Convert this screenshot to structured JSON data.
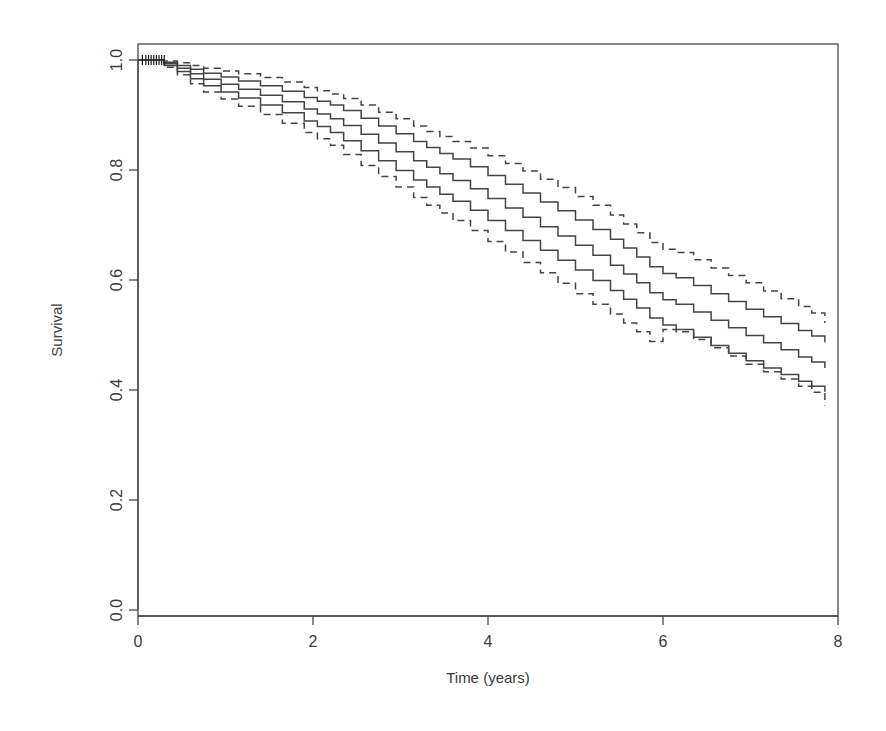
{
  "figure": {
    "kind": "kaplan-meier-survival-plot",
    "background_color": "#ffffff",
    "line_color": "#444444"
  },
  "chart_data": {
    "type": "line",
    "title": "",
    "subtitle": "",
    "xlabel": "Time (years)",
    "ylabel": "Survival",
    "xlim": [
      0,
      8
    ],
    "ylim": [
      0.0,
      1.0
    ],
    "xticks": [
      0,
      2,
      4,
      6,
      8
    ],
    "xtick_labels": [
      "0",
      "2",
      "4",
      "6",
      "8"
    ],
    "yticks": [
      0.0,
      0.2,
      0.4,
      0.6,
      0.8,
      1.0
    ],
    "ytick_labels": [
      "0.0",
      "0.2",
      "0.4",
      "0.6",
      "0.8",
      "1.0"
    ],
    "grid": false,
    "legend": "none",
    "legend_position": "none",
    "step_shape": "hv",
    "annotations": [
      "Censoring tick marks clustered near t = 0.1-0.3 at survival 1.0"
    ],
    "series": [
      {
        "name": "Upper 95% confidence band",
        "style": "dashed",
        "color": "#444444",
        "x": [
          0.0,
          0.3,
          0.45,
          0.6,
          0.75,
          0.95,
          1.15,
          1.4,
          1.65,
          1.9,
          2.05,
          2.2,
          2.35,
          2.55,
          2.75,
          2.95,
          3.15,
          3.3,
          3.45,
          3.6,
          3.8,
          4.0,
          4.2,
          4.4,
          4.6,
          4.8,
          5.0,
          5.2,
          5.4,
          5.55,
          5.7,
          5.85,
          6.0,
          6.15,
          6.35,
          6.55,
          6.75,
          6.95,
          7.15,
          7.35,
          7.55,
          7.7,
          7.85
        ],
        "y": [
          1.0,
          0.998,
          0.995,
          0.99,
          0.985,
          0.98,
          0.975,
          0.968,
          0.96,
          0.95,
          0.944,
          0.938,
          0.93,
          0.918,
          0.905,
          0.893,
          0.88,
          0.87,
          0.861,
          0.852,
          0.84,
          0.826,
          0.812,
          0.798,
          0.783,
          0.768,
          0.752,
          0.736,
          0.718,
          0.702,
          0.686,
          0.668,
          0.656,
          0.65,
          0.637,
          0.622,
          0.608,
          0.595,
          0.58,
          0.566,
          0.552,
          0.54,
          0.522
        ]
      },
      {
        "name": "Upper survival estimate",
        "style": "solid",
        "color": "#444444",
        "x": [
          0.0,
          0.3,
          0.45,
          0.6,
          0.75,
          0.95,
          1.15,
          1.4,
          1.65,
          1.9,
          2.05,
          2.2,
          2.35,
          2.55,
          2.75,
          2.95,
          3.15,
          3.3,
          3.45,
          3.6,
          3.8,
          4.0,
          4.2,
          4.4,
          4.6,
          4.8,
          5.0,
          5.2,
          5.4,
          5.55,
          5.7,
          5.85,
          6.0,
          6.15,
          6.35,
          6.55,
          6.75,
          6.95,
          7.15,
          7.35,
          7.55,
          7.7,
          7.85
        ],
        "y": [
          1.0,
          0.996,
          0.99,
          0.983,
          0.976,
          0.969,
          0.962,
          0.953,
          0.943,
          0.932,
          0.925,
          0.918,
          0.908,
          0.894,
          0.88,
          0.866,
          0.852,
          0.841,
          0.83,
          0.82,
          0.806,
          0.79,
          0.774,
          0.758,
          0.742,
          0.726,
          0.709,
          0.692,
          0.674,
          0.658,
          0.642,
          0.624,
          0.612,
          0.604,
          0.59,
          0.575,
          0.561,
          0.547,
          0.533,
          0.521,
          0.508,
          0.498,
          0.487
        ]
      },
      {
        "name": "Central survival estimate",
        "style": "solid",
        "color": "#444444",
        "x": [
          0.0,
          0.3,
          0.45,
          0.6,
          0.75,
          0.95,
          1.15,
          1.4,
          1.65,
          1.9,
          2.05,
          2.2,
          2.35,
          2.55,
          2.75,
          2.95,
          3.15,
          3.3,
          3.45,
          3.6,
          3.8,
          4.0,
          4.2,
          4.4,
          4.6,
          4.8,
          5.0,
          5.2,
          5.4,
          5.55,
          5.7,
          5.85,
          6.0,
          6.15,
          6.35,
          6.55,
          6.75,
          6.95,
          7.15,
          7.35,
          7.55,
          7.7,
          7.85
        ],
        "y": [
          1.0,
          0.993,
          0.985,
          0.975,
          0.965,
          0.956,
          0.947,
          0.936,
          0.924,
          0.911,
          0.902,
          0.893,
          0.881,
          0.865,
          0.849,
          0.833,
          0.817,
          0.805,
          0.793,
          0.781,
          0.766,
          0.748,
          0.731,
          0.714,
          0.697,
          0.68,
          0.663,
          0.645,
          0.627,
          0.611,
          0.595,
          0.577,
          0.564,
          0.556,
          0.542,
          0.527,
          0.513,
          0.499,
          0.486,
          0.473,
          0.46,
          0.451,
          0.44
        ]
      },
      {
        "name": "Lower survival estimate",
        "style": "solid",
        "color": "#444444",
        "x": [
          0.0,
          0.3,
          0.45,
          0.6,
          0.75,
          0.95,
          1.15,
          1.4,
          1.65,
          1.9,
          2.05,
          2.2,
          2.35,
          2.55,
          2.75,
          2.95,
          3.15,
          3.3,
          3.45,
          3.6,
          3.8,
          4.0,
          4.2,
          4.4,
          4.6,
          4.8,
          5.0,
          5.2,
          5.4,
          5.55,
          5.7,
          5.85,
          6.0,
          6.15,
          6.35,
          6.55,
          6.75,
          6.95,
          7.15,
          7.35,
          7.55,
          7.7,
          7.85
        ],
        "y": [
          1.0,
          0.99,
          0.979,
          0.966,
          0.953,
          0.942,
          0.931,
          0.918,
          0.904,
          0.889,
          0.879,
          0.868,
          0.853,
          0.835,
          0.817,
          0.799,
          0.782,
          0.769,
          0.756,
          0.743,
          0.727,
          0.708,
          0.69,
          0.672,
          0.654,
          0.636,
          0.618,
          0.599,
          0.581,
          0.565,
          0.549,
          0.531,
          0.518,
          0.51,
          0.496,
          0.481,
          0.467,
          0.453,
          0.44,
          0.428,
          0.416,
          0.407,
          0.397
        ]
      },
      {
        "name": "Lower 95% confidence band",
        "style": "dashed",
        "color": "#444444",
        "x": [
          0.0,
          0.3,
          0.45,
          0.6,
          0.75,
          0.95,
          1.15,
          1.4,
          1.65,
          1.9,
          2.05,
          2.2,
          2.35,
          2.55,
          2.75,
          2.95,
          3.15,
          3.3,
          3.45,
          3.6,
          3.8,
          4.0,
          4.2,
          4.4,
          4.6,
          4.8,
          5.0,
          5.2,
          5.4,
          5.55,
          5.7,
          5.85,
          6.0,
          6.15,
          6.35,
          6.55,
          6.75,
          6.95,
          7.15,
          7.35,
          7.55,
          7.7,
          7.85
        ],
        "y": [
          1.0,
          0.987,
          0.973,
          0.957,
          0.942,
          0.929,
          0.916,
          0.901,
          0.885,
          0.868,
          0.857,
          0.845,
          0.828,
          0.808,
          0.788,
          0.769,
          0.75,
          0.736,
          0.722,
          0.708,
          0.69,
          0.67,
          0.651,
          0.632,
          0.613,
          0.594,
          0.575,
          0.556,
          0.538,
          0.522,
          0.506,
          0.488,
          0.51,
          0.506,
          0.492,
          0.477,
          0.462,
          0.447,
          0.433,
          0.42,
          0.407,
          0.396,
          0.372
        ]
      }
    ],
    "censor_marks": {
      "label": "censored-observations",
      "times": [
        0.05,
        0.09,
        0.12,
        0.15,
        0.18,
        0.21,
        0.24,
        0.27,
        0.3
      ],
      "survival": 1.0
    }
  }
}
